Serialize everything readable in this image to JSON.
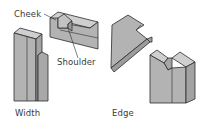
{
  "figure": {
    "labels": {
      "cheek": "Cheek",
      "shoulder": "Shoulder",
      "width": "Width",
      "edge": "Edge"
    },
    "colors": {
      "face_front": "#b3b3b3",
      "face_side": "#a3a3a3",
      "face_top": "#cfcfcf",
      "outline": "#2b2b2b",
      "text": "#3a3a3a",
      "background": "#ffffff"
    }
  }
}
